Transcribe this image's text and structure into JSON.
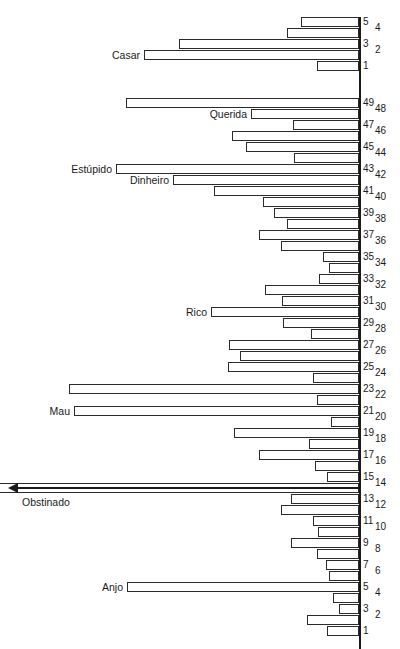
{
  "chart_data": {
    "type": "bar",
    "title": "",
    "subtitle": "",
    "xlabel": "",
    "ylabel": "",
    "orientation": "horizontal-left",
    "grid": false,
    "legend": null,
    "axis_position": "right",
    "baseline_x": 359,
    "xlim": [
      0,
      360
    ],
    "groups": [
      {
        "name": "top-group",
        "bars": [
          {
            "tick": "5",
            "value": 58,
            "label": ""
          },
          {
            "tick": "4",
            "value": 72,
            "label": ""
          },
          {
            "tick": "3",
            "value": 180,
            "label": ""
          },
          {
            "tick": "2",
            "value": 215,
            "label": "Casar"
          },
          {
            "tick": "1",
            "value": 42,
            "label": ""
          }
        ]
      },
      {
        "name": "main-group",
        "bars": [
          {
            "tick": "49",
            "value": 233,
            "label": ""
          },
          {
            "tick": "48",
            "value": 108,
            "label": "Querida"
          },
          {
            "tick": "47",
            "value": 66,
            "label": ""
          },
          {
            "tick": "46",
            "value": 127,
            "label": ""
          },
          {
            "tick": "45",
            "value": 113,
            "label": ""
          },
          {
            "tick": "44",
            "value": 65,
            "label": ""
          },
          {
            "tick": "43",
            "value": 243,
            "label": "Estúpido"
          },
          {
            "tick": "42",
            "value": 186,
            "label": "Dinheiro"
          },
          {
            "tick": "41",
            "value": 145,
            "label": ""
          },
          {
            "tick": "40",
            "value": 96,
            "label": ""
          },
          {
            "tick": "39",
            "value": 85,
            "label": ""
          },
          {
            "tick": "38",
            "value": 72,
            "label": ""
          },
          {
            "tick": "37",
            "value": 100,
            "label": ""
          },
          {
            "tick": "36",
            "value": 78,
            "label": ""
          },
          {
            "tick": "35",
            "value": 36,
            "label": ""
          },
          {
            "tick": "34",
            "value": 30,
            "label": ""
          },
          {
            "tick": "33",
            "value": 40,
            "label": ""
          },
          {
            "tick": "32",
            "value": 94,
            "label": ""
          },
          {
            "tick": "31",
            "value": 77,
            "label": ""
          },
          {
            "tick": "30",
            "value": 148,
            "label": "Rico"
          },
          {
            "tick": "29",
            "value": 76,
            "label": ""
          },
          {
            "tick": "28",
            "value": 48,
            "label": ""
          },
          {
            "tick": "27",
            "value": 130,
            "label": ""
          },
          {
            "tick": "26",
            "value": 119,
            "label": ""
          },
          {
            "tick": "25",
            "value": 131,
            "label": ""
          },
          {
            "tick": "24",
            "value": 46,
            "label": ""
          },
          {
            "tick": "23",
            "value": 290,
            "label": ""
          },
          {
            "tick": "22",
            "value": 42,
            "label": ""
          },
          {
            "tick": "21",
            "value": 285,
            "label": "Mau"
          },
          {
            "tick": "20",
            "value": 28,
            "label": ""
          },
          {
            "tick": "19",
            "value": 125,
            "label": ""
          },
          {
            "tick": "18",
            "value": 50,
            "label": ""
          },
          {
            "tick": "17",
            "value": 100,
            "label": ""
          },
          {
            "tick": "16",
            "value": 44,
            "label": ""
          },
          {
            "tick": "15",
            "value": 32,
            "label": ""
          },
          {
            "tick": "14",
            "value": 360,
            "label": "Obstinado",
            "overflow": true
          },
          {
            "tick": "13",
            "value": 68,
            "label": ""
          },
          {
            "tick": "12",
            "value": 78,
            "label": ""
          },
          {
            "tick": "11",
            "value": 46,
            "label": ""
          },
          {
            "tick": "10",
            "value": 41,
            "label": ""
          },
          {
            "tick": "9",
            "value": 68,
            "label": ""
          },
          {
            "tick": "8",
            "value": 42,
            "label": ""
          },
          {
            "tick": "7",
            "value": 33,
            "label": ""
          },
          {
            "tick": "6",
            "value": 30,
            "label": ""
          },
          {
            "tick": "5",
            "value": 232,
            "label": "Anjo"
          },
          {
            "tick": "4",
            "value": 26,
            "label": ""
          },
          {
            "tick": "3",
            "value": 20,
            "label": ""
          },
          {
            "tick": "2",
            "value": 52,
            "label": ""
          },
          {
            "tick": "1",
            "value": 32,
            "label": ""
          }
        ]
      }
    ]
  },
  "axis": {
    "tick_labels_top": [
      "5",
      "4",
      "3",
      "2",
      "1"
    ],
    "tick_labels_main": [
      "49",
      "48",
      "47",
      "46",
      "45",
      "44",
      "43",
      "42",
      "41",
      "40",
      "39",
      "38",
      "37",
      "36",
      "35",
      "34",
      "33",
      "32",
      "31",
      "30",
      "29",
      "28",
      "27",
      "26",
      "25",
      "24",
      "23",
      "22",
      "21",
      "20",
      "19",
      "18",
      "17",
      "16",
      "15",
      "14",
      "13",
      "12",
      "11",
      "10",
      "9",
      "8",
      "7",
      "6",
      "5",
      "4",
      "3",
      "2",
      "1"
    ]
  },
  "annotations": {
    "overflow_arrow_label": "Obstinado",
    "overflow_arrow_name": "off-scale-arrow"
  },
  "colors": {
    "bar_stroke": "#2b2b2b",
    "bar_fill": "#ffffff",
    "axis": "#1a1a1a",
    "text": "#1a1a1a",
    "background": "#ffffff"
  }
}
